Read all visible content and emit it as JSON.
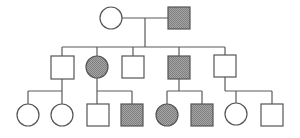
{
  "diagram": {
    "type": "pedigree",
    "colors": {
      "stroke": "#555555",
      "affected_fill": "#9a9a9a",
      "unaffected_fill": "#ffffff",
      "background": "#ffffff"
    },
    "generations": [
      {
        "id": "I",
        "individuals": [
          {
            "id": "I-1",
            "sex": "female",
            "shape": "circle",
            "affected": false
          },
          {
            "id": "I-2",
            "sex": "male",
            "shape": "square",
            "affected": true
          }
        ]
      },
      {
        "id": "II",
        "individuals": [
          {
            "id": "II-1",
            "sex": "male",
            "shape": "square",
            "affected": false
          },
          {
            "id": "II-2",
            "sex": "female",
            "shape": "circle",
            "affected": true
          },
          {
            "id": "II-3",
            "sex": "male",
            "shape": "square",
            "affected": false
          },
          {
            "id": "II-4",
            "sex": "male",
            "shape": "square",
            "affected": true
          },
          {
            "id": "II-5",
            "sex": "male",
            "shape": "square",
            "affected": false
          }
        ]
      },
      {
        "id": "III",
        "individuals": [
          {
            "id": "III-1",
            "sex": "female",
            "shape": "circle",
            "affected": false,
            "parent": "II-1"
          },
          {
            "id": "III-2",
            "sex": "female",
            "shape": "circle",
            "affected": false,
            "parent": "II-1"
          },
          {
            "id": "III-3",
            "sex": "male",
            "shape": "square",
            "affected": false,
            "parent": "II-2"
          },
          {
            "id": "III-4",
            "sex": "male",
            "shape": "square",
            "affected": true,
            "parent": "II-2"
          },
          {
            "id": "III-5",
            "sex": "female",
            "shape": "circle",
            "affected": true,
            "parent": "II-4"
          },
          {
            "id": "III-6",
            "sex": "male",
            "shape": "square",
            "affected": true,
            "parent": "II-4"
          },
          {
            "id": "III-7",
            "sex": "female",
            "shape": "circle",
            "affected": false,
            "parent": "II-5"
          },
          {
            "id": "III-8",
            "sex": "male",
            "shape": "square",
            "affected": false,
            "parent": "II-5"
          }
        ]
      }
    ],
    "matings": [
      {
        "partners": [
          "I-1",
          "I-2"
        ],
        "children": [
          "II-1",
          "II-2",
          "II-3",
          "II-4",
          "II-5"
        ]
      }
    ]
  }
}
